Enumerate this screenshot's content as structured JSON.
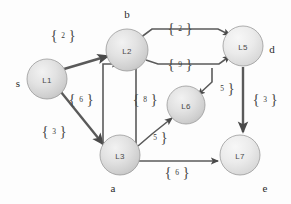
{
  "figure": {
    "background_color": "#fdfdfd",
    "node_fill_color": "#dcdcdc",
    "node_stroke_color": "#9a9a9a",
    "edge_color": "#5a5a5a",
    "text_color": "#2b2b2b"
  },
  "nodes": [
    {
      "id": "L1",
      "label": "L1",
      "alias": "s",
      "cx": 47,
      "cy": 79,
      "r": 20
    },
    {
      "id": "L2",
      "label": "L2",
      "alias": "b",
      "cx": 127,
      "cy": 50,
      "r": 21
    },
    {
      "id": "L3",
      "label": "L3",
      "alias": "a",
      "cx": 120,
      "cy": 155,
      "r": 20
    },
    {
      "id": "L5",
      "label": "L5",
      "alias": "d",
      "cx": 243,
      "cy": 46,
      "r": 20
    },
    {
      "id": "L6",
      "label": "L6",
      "alias": "",
      "cx": 186,
      "cy": 105,
      "r": 19
    },
    {
      "id": "L7",
      "label": "L7",
      "alias": "e",
      "cx": 240,
      "cy": 155,
      "r": 20
    }
  ],
  "aliases": [
    {
      "text": "s",
      "x": 18,
      "y": 83
    },
    {
      "text": "b",
      "x": 127,
      "y": 14
    },
    {
      "text": "d",
      "x": 272,
      "y": 49
    },
    {
      "text": "a",
      "x": 113,
      "y": 188
    },
    {
      "text": "e",
      "x": 265,
      "y": 188
    }
  ],
  "edges": [
    {
      "from": "L1",
      "to": "L2",
      "weight": "2",
      "label_x": 63,
      "label_y": 35
    },
    {
      "from": "L1",
      "to": "L3",
      "weight": "3",
      "label_x": 54,
      "label_y": 131
    },
    {
      "from": "L3",
      "to": "L2",
      "weight": "6",
      "label_x": 81,
      "label_y": 99
    },
    {
      "from": "L2",
      "to": "L3",
      "weight": "8",
      "label_x": 145,
      "label_y": 99
    },
    {
      "from": "L2",
      "to": "L5",
      "weight": "2",
      "label_x": 180,
      "label_y": 28
    },
    {
      "from": "L2",
      "to": "L5",
      "weight": "9",
      "label_x": 180,
      "label_y": 64
    },
    {
      "from": "L5",
      "to": "L6",
      "weight": "5",
      "label_x": 222,
      "label_y": 88
    },
    {
      "from": "L3",
      "to": "L6",
      "weight": "5",
      "label_x": 155,
      "label_y": 137
    },
    {
      "from": "L5",
      "to": "L7",
      "weight": "3",
      "label_x": 265,
      "label_y": 99
    },
    {
      "from": "L3",
      "to": "L7",
      "weight": "6",
      "label_x": 177,
      "label_y": 172
    }
  ],
  "weight_labels": [
    {
      "id": "w-l1-l2",
      "text": "2",
      "x": 63,
      "y": 35
    },
    {
      "id": "w-l1-l3",
      "text": "3",
      "x": 54,
      "y": 131
    },
    {
      "id": "w-l3-l2",
      "text": "6",
      "x": 81,
      "y": 99
    },
    {
      "id": "w-l2-l3",
      "text": "8",
      "x": 145,
      "y": 99
    },
    {
      "id": "w-l2-l5-top",
      "text": "2",
      "x": 180,
      "y": 28
    },
    {
      "id": "w-l2-l5-mid",
      "text": "9",
      "x": 180,
      "y": 64
    },
    {
      "id": "w-l5-l6",
      "text": "5",
      "x": 222,
      "y": 88
    },
    {
      "id": "w-l3-l6",
      "text": "5",
      "x": 155,
      "y": 137
    },
    {
      "id": "w-l5-l7",
      "text": "3",
      "x": 265,
      "y": 99
    },
    {
      "id": "w-l3-l7",
      "text": "6",
      "x": 177,
      "y": 172
    }
  ]
}
